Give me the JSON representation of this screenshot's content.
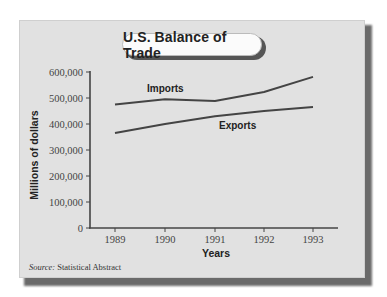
{
  "chart_data": {
    "type": "line",
    "title": "U.S. Balance of Trade",
    "xlabel": "Years",
    "ylabel": "Millions of dollars",
    "x": [
      "1989",
      "1990",
      "1991",
      "1992",
      "1993"
    ],
    "series": [
      {
        "name": "Imports",
        "values": [
          475000,
          495000,
          488000,
          523000,
          581000
        ]
      },
      {
        "name": "Exports",
        "values": [
          365000,
          400000,
          430000,
          450000,
          465000
        ]
      }
    ],
    "ylim": [
      0,
      600000
    ],
    "yticks": [
      0,
      100000,
      200000,
      300000,
      400000,
      500000,
      600000
    ],
    "ytick_labels": [
      "0",
      "100,000",
      "200,000",
      "300,000",
      "400,000",
      "500,000",
      "600,000"
    ],
    "grid": false,
    "legend": "inline labels",
    "source": "Statistical Abstract"
  },
  "labels": {
    "title": "U.S. Balance of Trade",
    "xlabel": "Years",
    "ylabel": "Millions of dollars",
    "imports": "Imports",
    "exports": "Exports",
    "source_key": "Source:",
    "source_value": " Statistical Abstract",
    "ytick_0": "0",
    "ytick_1": "100,000",
    "ytick_2": "200,000",
    "ytick_3": "300,000",
    "ytick_4": "400,000",
    "ytick_5": "500,000",
    "ytick_6": "600,000",
    "xtick_0": "1989",
    "xtick_1": "1990",
    "xtick_2": "1991",
    "xtick_3": "1992",
    "xtick_4": "1993"
  },
  "colors": {
    "panel": "#e1e1e1",
    "line": "#444444",
    "shadow": "#6a6a6a"
  }
}
